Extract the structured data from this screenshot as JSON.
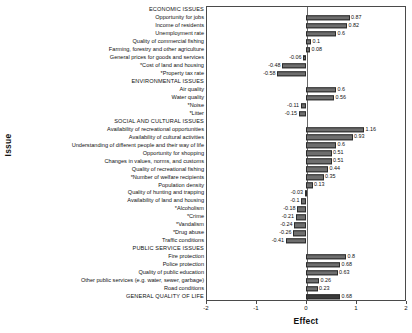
{
  "chart_data": {
    "type": "bar",
    "orientation": "horizontal",
    "title": "",
    "xlabel": "Effect",
    "ylabel": "Issue",
    "xlim": [
      -2,
      2
    ],
    "xticks": [
      -2,
      -1,
      0,
      1,
      2
    ],
    "xtick_labels": [
      "-2",
      "-1",
      "0",
      "1",
      "2"
    ],
    "grid": false,
    "legend": null,
    "zero_reference_line": true,
    "bar_color": "#6e6e6e",
    "bar_edge_color": "#2b2b2b",
    "highlight_color": "#3a3a3a",
    "categories": [
      "ECONOMIC ISSUES",
      "Opportunity for jobs",
      "Income of residents",
      "Unemployment rate",
      "Quality of commercial fishing",
      "Farming, forestry and other agriculture",
      "General prices for goods and services",
      "*Cost of land and housing",
      "*Property tax rate",
      "ENVIRONMENTAL ISSUES",
      "Air quality",
      "Water quality",
      "*Noise",
      "*Litter",
      "SOCIAL AND CULTURAL ISSUES",
      "Availability of recreational opportunities",
      "Availability of cultural activities",
      "Understanding of different people and their way of life",
      "Opportunity for shopping",
      "Changes in values, norms, and customs",
      "Quality of recreational fishing",
      "*Number of welfare recipients",
      "Population density",
      "Quality of hunting and trapping",
      "Availability of land and housing",
      "*Alcoholism",
      "*Crime",
      "*Vandalism",
      "*Drug abuse",
      "Traffic conditions",
      "PUBLIC SERVICE ISSUES",
      "Fire protection",
      "Police protection",
      "Quality of public education",
      "Other public services (e.g. water, sewer, garbage)",
      "Road conditions",
      "GENERAL QUALITY OF LIFE"
    ],
    "values": [
      null,
      0.87,
      0.82,
      0.6,
      0.1,
      0.08,
      -0.06,
      -0.48,
      -0.58,
      null,
      0.6,
      0.56,
      -0.11,
      -0.15,
      null,
      1.16,
      0.93,
      0.6,
      0.51,
      0.51,
      0.44,
      0.35,
      0.13,
      -0.03,
      -0.1,
      -0.18,
      -0.21,
      -0.24,
      -0.26,
      -0.41,
      null,
      0.8,
      0.68,
      0.63,
      0.26,
      0.23,
      0.68
    ],
    "value_labels": [
      "",
      "0.87",
      "0.82",
      "0.6",
      "0.1",
      "0.08",
      "-0.06",
      "-0.48",
      "-0.58",
      "",
      "0.6",
      "0.56",
      "-0.11",
      "-0.15",
      "",
      "1.16",
      "0.93",
      "0.6",
      "0.51",
      "0.51",
      "0.44",
      "0.35",
      "0.13",
      "-0.03",
      "-0.1",
      "-0.18",
      "-0.21",
      "-0.24",
      "-0.26",
      "-0.41",
      "",
      "0.8",
      "0.68",
      "0.63",
      "0.26",
      "0.23",
      "0.68"
    ],
    "section_headers": [
      "ECONOMIC ISSUES",
      "ENVIRONMENTAL ISSUES",
      "SOCIAL AND CULTURAL ISSUES",
      "PUBLIC SERVICE ISSUES",
      "GENERAL QUALITY OF LIFE"
    ]
  }
}
